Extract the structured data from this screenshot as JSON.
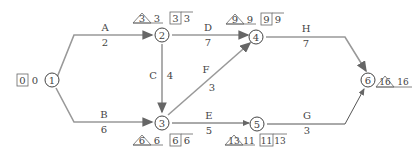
{
  "diagram": {
    "type": "activity-on-arrow network",
    "nodes": [
      {
        "id": "1",
        "label": "1",
        "est_box": "0",
        "lst": "0"
      },
      {
        "id": "2",
        "label": "2",
        "tri": "3",
        "tri_val": "3",
        "box1": "3",
        "box2": "3"
      },
      {
        "id": "3",
        "label": "3",
        "tri": "6",
        "tri_val": "6",
        "box1": "6",
        "box2": "6"
      },
      {
        "id": "4",
        "label": "4",
        "tri": "9",
        "tri_val": "9",
        "box1": "9",
        "box2": "9"
      },
      {
        "id": "5",
        "label": "5",
        "tri": "13",
        "tri_val": "11",
        "box1": "11",
        "box2": "13"
      },
      {
        "id": "6",
        "label": "6",
        "tri": "16",
        "tri_val": "16"
      }
    ],
    "activities": [
      {
        "name": "A",
        "duration": "2",
        "from": "1",
        "to": "2"
      },
      {
        "name": "B",
        "duration": "6",
        "from": "1",
        "to": "3"
      },
      {
        "name": "C",
        "duration": "4",
        "from": "2",
        "to": "3"
      },
      {
        "name": "D",
        "duration": "7",
        "from": "2",
        "to": "4"
      },
      {
        "name": "E",
        "duration": "5",
        "from": "3",
        "to": "5"
      },
      {
        "name": "F",
        "duration": "3",
        "from": "3",
        "to": "4"
      },
      {
        "name": "G",
        "duration": "3",
        "from": "5",
        "to": "6"
      },
      {
        "name": "H",
        "duration": "7",
        "from": "4",
        "to": "6"
      }
    ]
  }
}
